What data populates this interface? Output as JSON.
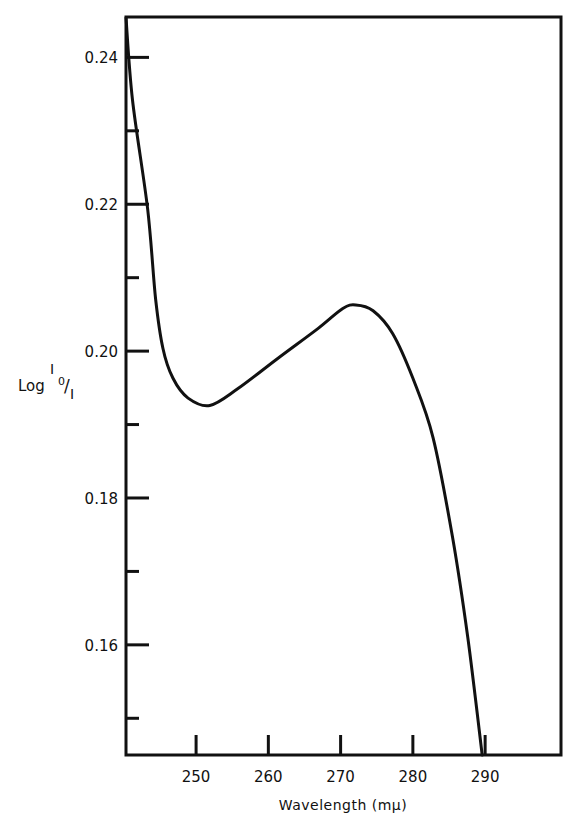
{
  "chart_data": {
    "type": "line",
    "title": "",
    "xlabel": "Wavelength (mμ)",
    "ylabel": {
      "prefix": "Log",
      "numerator": "I",
      "subscript": "0",
      "slash": "/",
      "denominator": "I"
    },
    "xlim": [
      240.3,
      300.5
    ],
    "ylim": [
      0.145,
      0.2455
    ],
    "grid": false,
    "legend": "none",
    "x_ticks": [
      250,
      260,
      270,
      280,
      290
    ],
    "x_tick_labels": [
      "250",
      "260",
      "270",
      "280",
      "290"
    ],
    "y_major_ticks": [
      0.24,
      0.22,
      0.2,
      0.18,
      0.16
    ],
    "y_tick_labels": [
      "0.24",
      "0.22",
      "0.20",
      "0.18",
      "0.16"
    ],
    "y_minor_ticks": [
      0.23,
      0.21,
      0.19,
      0.17,
      0.15
    ],
    "series": [
      {
        "name": "absorption",
        "x": [
          240.3,
          241.2,
          243.3,
          244.4,
          245.4,
          246.8,
          248.9,
          251.9,
          255.8,
          261.3,
          266.9,
          270.3,
          272.1,
          274.5,
          277.2,
          280.0,
          282.8,
          285.5,
          287.6,
          289.6
        ],
        "y": [
          0.2454,
          0.2342,
          0.2193,
          0.2071,
          0.2004,
          0.1963,
          0.1936,
          0.1926,
          0.1949,
          0.199,
          0.2031,
          0.2058,
          0.2063,
          0.2055,
          0.2024,
          0.1963,
          0.1882,
          0.1746,
          0.161,
          0.145
        ]
      }
    ]
  }
}
